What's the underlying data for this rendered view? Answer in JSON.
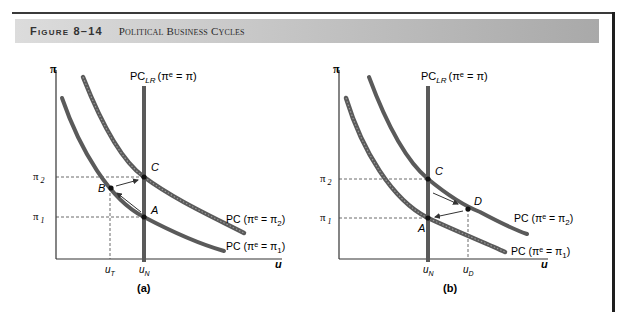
{
  "header": {
    "figure_number": "Figure 8–14",
    "figure_title": "Political Business Cycles"
  },
  "panels": [
    {
      "id": "a",
      "label": "(a)",
      "y_axis_label": "π",
      "x_axis_label": "u",
      "long_run_curve_label": "PC",
      "long_run_sub": "LR",
      "long_run_eq": "(πᵉ = π)",
      "pi2_label": "π",
      "pi2_sub": "2",
      "pi1_label": "π",
      "pi1_sub": "1",
      "curve_high_label": "PC (πᵉ = π",
      "curve_high_sub": "2",
      "curve_low_label": "PC (πᵉ = π",
      "curve_low_sub": "1",
      "close_paren": ")",
      "points": {
        "A": "A",
        "B": "B",
        "C": "C"
      },
      "x_ticks": [
        {
          "label": "u",
          "sub": "T"
        },
        {
          "label": "u",
          "sub": "N"
        }
      ]
    },
    {
      "id": "b",
      "label": "(b)",
      "y_axis_label": "π",
      "x_axis_label": "u",
      "long_run_curve_label": "PC",
      "long_run_sub": "LR",
      "long_run_eq": "(πᵉ = π)",
      "pi2_label": "π",
      "pi2_sub": "2",
      "pi1_label": "π",
      "pi1_sub": "1",
      "curve_high_label": "PC (πᵉ = π",
      "curve_high_sub": "2",
      "curve_low_label": "PC (πᵉ = π",
      "curve_low_sub": "1",
      "close_paren": ")",
      "points": {
        "A": "A",
        "C": "C",
        "D": "D"
      },
      "x_ticks": [
        {
          "label": "u",
          "sub": "N"
        },
        {
          "label": "u",
          "sub": "D"
        }
      ]
    }
  ],
  "colors": {
    "curve": "#5a5a5a",
    "axis": "#333333",
    "dashed": "#444444",
    "point": "#111111"
  }
}
